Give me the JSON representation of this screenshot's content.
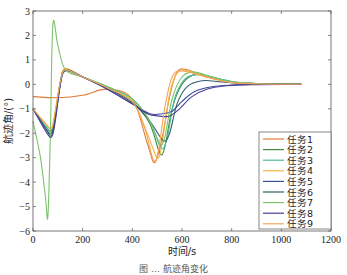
{
  "chart_data": {
    "type": "line",
    "title": "",
    "xlabel": "时间/s",
    "ylabel": "航迹角/(°)",
    "xlim": [
      0,
      1200
    ],
    "ylim": [
      -6,
      3
    ],
    "xticks": [
      0,
      200,
      400,
      600,
      800,
      1000,
      1200
    ],
    "yticks": [
      -6,
      -5,
      -4,
      -3,
      -2,
      -1,
      0,
      1,
      2,
      3
    ],
    "grid": false,
    "legend_position": "lower right",
    "series": [
      {
        "name": "任务1",
        "color": "#e07b39",
        "points": [
          [
            0,
            -0.5
          ],
          [
            100,
            -0.55
          ],
          [
            200,
            -0.45
          ],
          [
            300,
            -0.2
          ],
          [
            400,
            -0.6
          ],
          [
            460,
            -2.4
          ],
          [
            490,
            -3.2
          ],
          [
            520,
            -2.2
          ],
          [
            550,
            -0.5
          ],
          [
            580,
            0.5
          ],
          [
            620,
            0.6
          ],
          [
            700,
            0.3
          ],
          [
            800,
            0.1
          ],
          [
            900,
            0.03
          ],
          [
            1000,
            0.0
          ],
          [
            1080,
            0.0
          ]
        ]
      },
      {
        "name": "任务2",
        "color": "#3f8a3f",
        "points": [
          [
            0,
            -1.0
          ],
          [
            50,
            -1.7
          ],
          [
            75,
            -1.9
          ],
          [
            90,
            -1.2
          ],
          [
            110,
            0.1
          ],
          [
            130,
            0.6
          ],
          [
            200,
            0.3
          ],
          [
            300,
            -0.1
          ],
          [
            400,
            -0.7
          ],
          [
            470,
            -1.6
          ],
          [
            510,
            -2.8
          ],
          [
            530,
            -2.6
          ],
          [
            560,
            -1.0
          ],
          [
            600,
            0.0
          ],
          [
            650,
            0.4
          ],
          [
            720,
            0.3
          ],
          [
            800,
            0.1
          ],
          [
            900,
            0.03
          ],
          [
            1000,
            0.0
          ],
          [
            1080,
            0.0
          ]
        ]
      },
      {
        "name": "任务3",
        "color": "#4db8a0",
        "points": [
          [
            0,
            -1.0
          ],
          [
            50,
            -1.7
          ],
          [
            75,
            -1.9
          ],
          [
            90,
            -1.2
          ],
          [
            110,
            0.1
          ],
          [
            130,
            0.6
          ],
          [
            200,
            0.3
          ],
          [
            300,
            -0.1
          ],
          [
            400,
            -0.6
          ],
          [
            470,
            -1.5
          ],
          [
            515,
            -2.6
          ],
          [
            540,
            -2.2
          ],
          [
            570,
            -0.6
          ],
          [
            610,
            0.2
          ],
          [
            660,
            0.4
          ],
          [
            740,
            0.25
          ],
          [
            820,
            0.08
          ],
          [
            920,
            0.02
          ],
          [
            1080,
            0.0
          ]
        ]
      },
      {
        "name": "任务4",
        "color": "#f0b942",
        "points": [
          [
            0,
            -1.0
          ],
          [
            50,
            -1.6
          ],
          [
            75,
            -1.8
          ],
          [
            90,
            -1.1
          ],
          [
            110,
            0.1
          ],
          [
            130,
            0.65
          ],
          [
            200,
            0.3
          ],
          [
            300,
            -0.15
          ],
          [
            400,
            -0.7
          ],
          [
            460,
            -2.0
          ],
          [
            500,
            -3.0
          ],
          [
            520,
            -2.4
          ],
          [
            550,
            -0.4
          ],
          [
            580,
            0.45
          ],
          [
            620,
            0.55
          ],
          [
            700,
            0.3
          ],
          [
            800,
            0.08
          ],
          [
            900,
            0.02
          ],
          [
            1080,
            0.0
          ]
        ]
      },
      {
        "name": "任务5",
        "color": "#3a4f9c",
        "points": [
          [
            0,
            -1.0
          ],
          [
            50,
            -1.8
          ],
          [
            75,
            -2.1
          ],
          [
            90,
            -1.4
          ],
          [
            110,
            0.0
          ],
          [
            130,
            0.6
          ],
          [
            200,
            0.3
          ],
          [
            300,
            -0.2
          ],
          [
            400,
            -0.8
          ],
          [
            470,
            -1.2
          ],
          [
            520,
            -1.2
          ],
          [
            560,
            -1.1
          ],
          [
            600,
            -0.7
          ],
          [
            650,
            -0.3
          ],
          [
            720,
            -0.1
          ],
          [
            800,
            -0.03
          ],
          [
            900,
            0.0
          ],
          [
            1080,
            0.0
          ]
        ]
      },
      {
        "name": "任务6",
        "color": "#2f5f6a",
        "points": [
          [
            0,
            -1.0
          ],
          [
            50,
            -1.8
          ],
          [
            75,
            -2.0
          ],
          [
            90,
            -1.3
          ],
          [
            110,
            0.0
          ],
          [
            130,
            0.55
          ],
          [
            200,
            0.3
          ],
          [
            300,
            -0.15
          ],
          [
            400,
            -0.75
          ],
          [
            470,
            -1.5
          ],
          [
            525,
            -2.3
          ],
          [
            550,
            -2.0
          ],
          [
            580,
            -0.8
          ],
          [
            620,
            -0.1
          ],
          [
            680,
            0.15
          ],
          [
            760,
            0.1
          ],
          [
            860,
            0.03
          ],
          [
            1080,
            0.0
          ]
        ]
      },
      {
        "name": "任务7",
        "color": "#7cc46a",
        "points": [
          [
            0,
            -1.5
          ],
          [
            30,
            -3.0
          ],
          [
            50,
            -4.6
          ],
          [
            60,
            -5.4
          ],
          [
            70,
            -2.0
          ],
          [
            80,
            2.45
          ],
          [
            100,
            1.6
          ],
          [
            130,
            0.6
          ],
          [
            200,
            0.3
          ],
          [
            300,
            -0.1
          ],
          [
            400,
            -0.6
          ],
          [
            470,
            -1.5
          ],
          [
            510,
            -2.4
          ],
          [
            530,
            -2.2
          ],
          [
            560,
            -0.6
          ],
          [
            600,
            0.3
          ],
          [
            650,
            0.5
          ],
          [
            720,
            0.3
          ],
          [
            800,
            0.1
          ],
          [
            900,
            0.03
          ],
          [
            1080,
            0.0
          ]
        ]
      },
      {
        "name": "任务8",
        "color": "#4b3f8f",
        "points": [
          [
            0,
            -1.0
          ],
          [
            50,
            -1.9
          ],
          [
            75,
            -2.15
          ],
          [
            90,
            -1.5
          ],
          [
            110,
            0.0
          ],
          [
            130,
            0.6
          ],
          [
            200,
            0.3
          ],
          [
            300,
            -0.2
          ],
          [
            400,
            -0.8
          ],
          [
            460,
            -1.2
          ],
          [
            510,
            -1.3
          ],
          [
            550,
            -1.3
          ],
          [
            590,
            -1.0
          ],
          [
            640,
            -0.5
          ],
          [
            700,
            -0.2
          ],
          [
            780,
            -0.06
          ],
          [
            880,
            -0.01
          ],
          [
            1080,
            0.0
          ]
        ]
      },
      {
        "name": "任务9",
        "color": "#f5a65b",
        "points": [
          [
            0,
            -1.0
          ],
          [
            50,
            -1.6
          ],
          [
            75,
            -1.8
          ],
          [
            90,
            -1.1
          ],
          [
            110,
            0.1
          ],
          [
            130,
            0.6
          ],
          [
            200,
            0.3
          ],
          [
            300,
            -0.15
          ],
          [
            400,
            -0.7
          ],
          [
            450,
            -1.8
          ],
          [
            485,
            -3.1
          ],
          [
            505,
            -2.7
          ],
          [
            530,
            -1.0
          ],
          [
            560,
            0.3
          ],
          [
            600,
            0.55
          ],
          [
            680,
            0.35
          ],
          [
            780,
            0.1
          ],
          [
            880,
            0.02
          ],
          [
            1080,
            0.0
          ]
        ]
      }
    ]
  },
  "caption": "图 … 航迹角变化"
}
